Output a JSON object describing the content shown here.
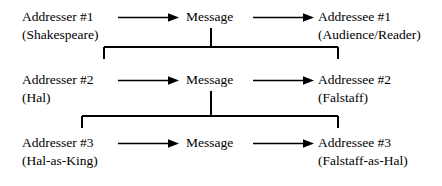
{
  "diagram": {
    "background_color": "#ffffff",
    "line_color": "#000000",
    "rows": [
      {
        "id": "row-1",
        "addresser": {
          "label": "Addresser #1",
          "detail": "(Shakespeare)"
        },
        "message": {
          "label": "Message",
          "detail": ""
        },
        "addressee": {
          "label": "Addressee #1",
          "detail": "(Audience/Reader)"
        }
      },
      {
        "id": "row-2",
        "addresser": {
          "label": "Addresser #2",
          "detail": "(Hal)"
        },
        "message": {
          "label": "Message",
          "detail": ""
        },
        "addressee": {
          "label": "Addressee #2",
          "detail": "(Falstaff)"
        }
      },
      {
        "id": "row-3",
        "addresser": {
          "label": "Addresser #3",
          "detail": "(Hal-as-King)"
        },
        "message": {
          "label": "Message",
          "detail": ""
        },
        "addressee": {
          "label": "Addressee #3",
          "detail": "(Falstaff-as-Hal)"
        }
      }
    ],
    "arrows": {
      "addresser_to_message": "arrow-right",
      "message_to_addressee": "arrow-right"
    },
    "connectors": [
      {
        "id": "connector-1",
        "from": "row-1-message",
        "to": "row-2",
        "shape": "bracket-down"
      },
      {
        "id": "connector-2",
        "from": "row-2-message",
        "to": "row-3",
        "shape": "bracket-down"
      }
    ]
  }
}
